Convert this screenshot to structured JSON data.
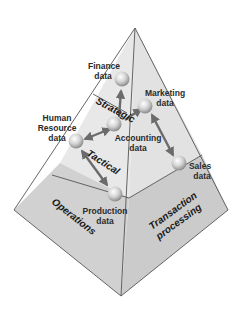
{
  "colors": {
    "background": "#ffffff",
    "face_upper": "#e6e6e6",
    "face_lower": "#cfcfcf",
    "edge": "#555555",
    "arrow": "#6b6b6b",
    "node_fill": "#d8d8d8",
    "text": "#2b2b2b"
  },
  "levels": {
    "strategic": "Strategic",
    "tactical": "Tactical",
    "operations": "Operations",
    "transaction_line1": "Transaction",
    "transaction_line2": "processing"
  },
  "nodes": {
    "finance": {
      "line1": "Finance",
      "line2": "data"
    },
    "marketing": {
      "line1": "Marketing",
      "line2": "data"
    },
    "accounting": {
      "line1": "Accounting",
      "line2": "data"
    },
    "human_resource": {
      "line1": "Human",
      "line2": "Resource",
      "line3": "data"
    },
    "sales": {
      "line1": "Sales",
      "line2": "data"
    },
    "production": {
      "line1": "Production",
      "line2": "data"
    }
  }
}
